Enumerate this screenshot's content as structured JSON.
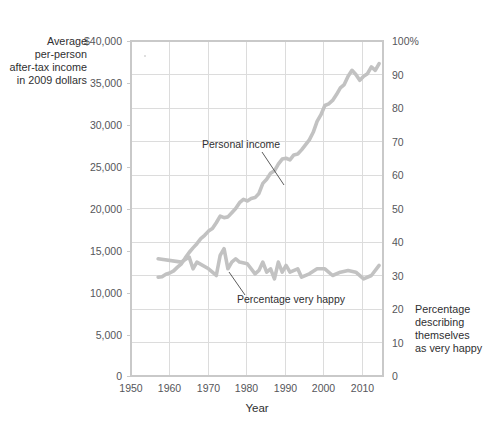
{
  "chart_data": {
    "type": "line",
    "title": "",
    "xlabel": "Year",
    "ylabel_left": "Average per-person after-tax income in 2009 dollars",
    "ylabel_right": "Percentage describing themselves as very happy",
    "left_axis": {
      "label_lines": [
        "Average",
        "per-person",
        "after-tax income",
        "in 2009 dollars"
      ],
      "ticks": [
        "$40,000",
        "35,000",
        "30,000",
        "25,000",
        "20,000",
        "15,000",
        "10,000",
        "5,000",
        "0"
      ],
      "tick_values": [
        40000,
        35000,
        30000,
        25000,
        20000,
        15000,
        10000,
        5000,
        0
      ],
      "ylim": [
        0,
        40000
      ]
    },
    "right_axis": {
      "label_lines": [
        "Percentage",
        "describing",
        "themselves",
        "as very happy"
      ],
      "ticks": [
        "100%",
        "90",
        "80",
        "70",
        "60",
        "50",
        "40",
        "30",
        "20",
        "10",
        "0"
      ],
      "tick_values": [
        100,
        90,
        80,
        70,
        60,
        50,
        40,
        30,
        20,
        10,
        0
      ],
      "ylim": [
        0,
        100
      ]
    },
    "x_axis": {
      "ticks": [
        "1950",
        "1960",
        "1970",
        "1980",
        "1990",
        "2000",
        "2010"
      ],
      "tick_values": [
        1950,
        1960,
        1970,
        1980,
        1990,
        2000,
        2010
      ],
      "xlim": [
        1950,
        2015
      ]
    },
    "grid": true,
    "legend": "inline-annotations",
    "series": [
      {
        "name": "Personal income",
        "axis": "left",
        "units": "2009 dollars",
        "color": "#c2c2c2",
        "x": [
          1957,
          1958,
          1959,
          1960,
          1961,
          1962,
          1963,
          1964,
          1965,
          1966,
          1967,
          1968,
          1969,
          1970,
          1971,
          1972,
          1973,
          1974,
          1975,
          1976,
          1977,
          1978,
          1979,
          1980,
          1981,
          1982,
          1983,
          1984,
          1985,
          1986,
          1987,
          1988,
          1989,
          1990,
          1991,
          1992,
          1993,
          1994,
          1995,
          1996,
          1997,
          1998,
          1999,
          2000,
          2001,
          2002,
          2003,
          2004,
          2005,
          2006,
          2007,
          2008,
          2009,
          2010,
          2011,
          2012,
          2013,
          2014
        ],
        "y": [
          11800,
          11850,
          12150,
          12300,
          12550,
          13000,
          13400,
          14100,
          14750,
          15300,
          15800,
          16400,
          16800,
          17300,
          17600,
          18300,
          19100,
          18900,
          19000,
          19500,
          20000,
          20700,
          21100,
          20900,
          21200,
          21300,
          21800,
          23000,
          23500,
          24200,
          24500,
          25300,
          25900,
          26000,
          25800,
          26400,
          26500,
          27000,
          27600,
          28200,
          29100,
          30400,
          31200,
          32300,
          32500,
          32900,
          33600,
          34400,
          34800,
          35800,
          36500,
          36000,
          35300,
          35800,
          36100,
          36900,
          36500,
          37300
        ],
        "description": "Steadily rising from about $11,800 in 1957 to about $37,000 in 2014"
      },
      {
        "name": "Percentage very happy",
        "axis": "right",
        "units": "percent",
        "color": "#c2c2c2",
        "x": [
          1957,
          1963,
          1965,
          1966,
          1967,
          1970,
          1971,
          1972,
          1973,
          1974,
          1975,
          1976,
          1977,
          1978,
          1980,
          1982,
          1983,
          1984,
          1985,
          1986,
          1987,
          1988,
          1989,
          1990,
          1991,
          1993,
          1994,
          1996,
          1998,
          2000,
          2002,
          2004,
          2006,
          2008,
          2010,
          2012,
          2014
        ],
        "y": [
          35.0,
          34.0,
          35.5,
          32.0,
          34.0,
          32.0,
          31.0,
          30.0,
          36.0,
          38.0,
          32.0,
          34.0,
          35.0,
          34.0,
          33.5,
          30.5,
          31.5,
          34.0,
          31.0,
          32.0,
          29.0,
          34.0,
          31.0,
          33.0,
          31.0,
          32.0,
          29.5,
          30.5,
          32.0,
          32.0,
          30.0,
          31.0,
          31.5,
          31.0,
          29.0,
          30.0,
          33.0
        ],
        "description": "Roughly flat around 30-35 percent from 1957 to 2014"
      }
    ],
    "annotations": [
      {
        "text": "Personal income",
        "series": "Personal income"
      },
      {
        "text": "Percentage very happy",
        "series": "Percentage very happy"
      }
    ]
  }
}
